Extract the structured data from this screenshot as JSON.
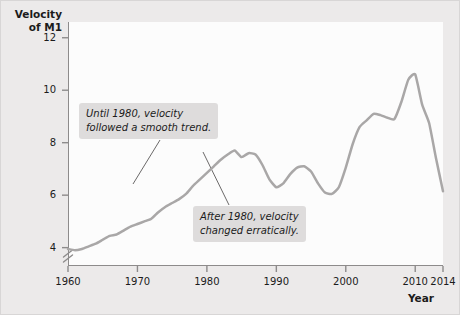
{
  "figure": {
    "background_color": "#eceaea",
    "plot_background_color": "#fcfcfc",
    "line_color": "#a9a7a7",
    "axis_color": "#8d8b8b",
    "annotation_background": "#dedcdc"
  },
  "axes": {
    "y_title": "Velocity\nof M1",
    "x_title": "Year",
    "y_ticks": [
      "4",
      "6",
      "8",
      "10",
      "12"
    ],
    "x_ticks": [
      "1960",
      "1970",
      "1980",
      "1990",
      "2000",
      "2010",
      "2014"
    ],
    "y_axis_break": true
  },
  "annotations": [
    {
      "name": "smooth-trend",
      "text": "Until 1980, velocity\nfollowed a smooth trend."
    },
    {
      "name": "erratic",
      "text": "After 1980, velocity\nchanged erratically."
    }
  ],
  "chart_data": {
    "type": "line",
    "title": "",
    "xlabel": "Year",
    "ylabel": "Velocity of M1",
    "xlim": [
      1960,
      2014
    ],
    "ylim": [
      3.3,
      12.6
    ],
    "yticks": [
      4,
      6,
      8,
      10,
      12
    ],
    "xticks": [
      1960,
      1970,
      1980,
      1990,
      2000,
      2010,
      2014
    ],
    "grid": false,
    "legend": "none",
    "y_axis_break_below": 4,
    "series": [
      {
        "name": "Velocity of M1",
        "x": [
          1960,
          1961,
          1962,
          1963,
          1964,
          1965,
          1966,
          1967,
          1968,
          1969,
          1970,
          1971,
          1972,
          1973,
          1974,
          1975,
          1976,
          1977,
          1978,
          1979,
          1980,
          1981,
          1982,
          1983,
          1984,
          1985,
          1986,
          1987,
          1988,
          1989,
          1990,
          1991,
          1992,
          1993,
          1994,
          1995,
          1996,
          1997,
          1998,
          1999,
          2000,
          2001,
          2002,
          2003,
          2004,
          2005,
          2006,
          2007,
          2008,
          2009,
          2010,
          2011,
          2012,
          2013,
          2014
        ],
        "values": [
          3.95,
          3.9,
          3.95,
          4.05,
          4.15,
          4.3,
          4.45,
          4.5,
          4.65,
          4.8,
          4.9,
          5.0,
          5.1,
          5.35,
          5.55,
          5.7,
          5.85,
          6.05,
          6.35,
          6.6,
          6.85,
          7.1,
          7.35,
          7.55,
          7.7,
          7.45,
          7.6,
          7.55,
          7.15,
          6.6,
          6.3,
          6.45,
          6.8,
          7.05,
          7.1,
          6.9,
          6.45,
          6.1,
          6.05,
          6.3,
          7.05,
          7.95,
          8.6,
          8.85,
          9.1,
          9.05,
          8.95,
          8.9,
          9.55,
          10.4,
          10.6,
          9.45,
          8.75,
          7.4,
          6.15
        ],
        "annotations": [
          {
            "label": "1980s peak",
            "x": 1984,
            "y": 7.7
          },
          {
            "label": "mid-1990s trough",
            "x": 1998,
            "y": 6.05
          },
          {
            "label": "2007 peak",
            "x": 2010,
            "y": 10.6
          },
          {
            "label": "final value",
            "x": 2014,
            "y": 6.15
          }
        ]
      }
    ]
  }
}
